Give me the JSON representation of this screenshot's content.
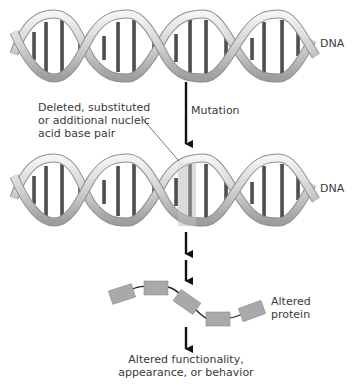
{
  "labels": {
    "dna_top": "DNA",
    "dna_bottom": "DNA",
    "mutation": "Mutation",
    "callout_line1": "Deleted, substituted",
    "callout_line2": "or additional nucleic",
    "callout_line3": "acid base pair",
    "protein_line1": "Altered",
    "protein_line2": "protein",
    "outcome_line1": "Altered functionality,",
    "outcome_line2": "appearance, or behavior"
  },
  "colors": {
    "strand_light": "#e6e6e6",
    "strand_dark": "#9a9a9a",
    "rung": "#555555",
    "highlight": "#d9d9d9",
    "protein_block": "#a9a9a9",
    "arrow": "#111111"
  }
}
